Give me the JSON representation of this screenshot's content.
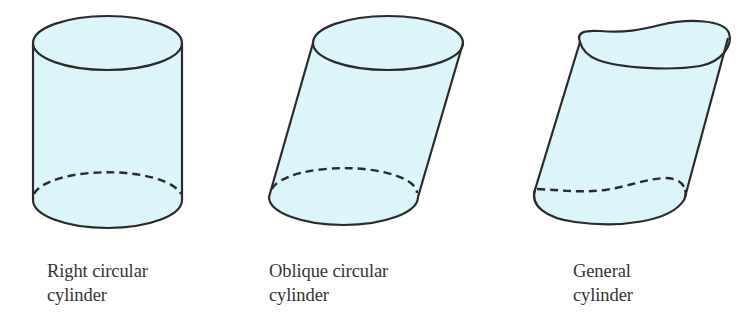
{
  "figure": {
    "colors": {
      "fill": "#dcf5fa",
      "stroke": "#2a2a2a",
      "background": "#ffffff",
      "text": "#333333"
    },
    "shapes": [
      {
        "id": "right-circular-cylinder",
        "caption_line1": "Right circular",
        "caption_line2": "cylinder"
      },
      {
        "id": "oblique-circular-cylinder",
        "caption_line1": "Oblique circular",
        "caption_line2": "cylinder"
      },
      {
        "id": "general-cylinder",
        "caption_line1": "General",
        "caption_line2": "cylinder"
      }
    ]
  }
}
